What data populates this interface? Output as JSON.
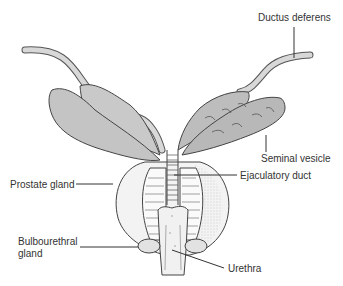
{
  "diagram": {
    "type": "anatomical illustration",
    "labels": {
      "ductus_deferens": "Ductus deferens",
      "seminal_vesicle": "Seminal vesicle",
      "prostate_gland": "Prostate gland",
      "ejaculatory_duct": "Ejaculatory duct",
      "bulbourethral_gland_line1": "Bulbourethral",
      "bulbourethral_gland_line2": "gland",
      "urethra": "Urethra"
    }
  }
}
